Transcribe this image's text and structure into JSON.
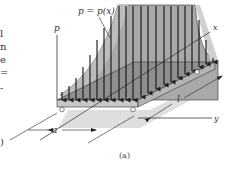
{
  "figure": {
    "caption": "(a)",
    "load_label": "p = p(x)",
    "axis_p": "p",
    "axis_x": "x",
    "axis_y": "y",
    "dim_a": "a",
    "dim_l": "l"
  },
  "left_text_fragments": [
    "l",
    "n",
    "e",
    "=",
    "-",
    ")"
  ],
  "colors": {
    "load_fill": "#a9a9a9",
    "plate_top": "#8f8f8f",
    "plate_side": "#c8c8c8",
    "shadow": "#d9d9d9",
    "line": "#222222"
  }
}
